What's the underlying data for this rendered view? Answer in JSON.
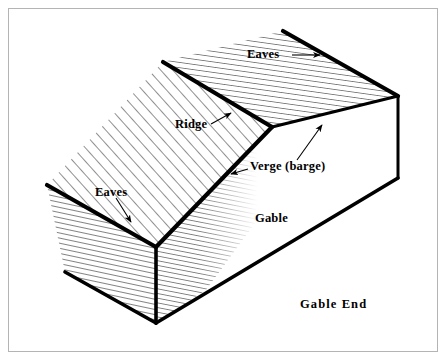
{
  "figure": {
    "background_color": "#ffffff",
    "frame_color": "#b4b4b4",
    "line_color": "#000000",
    "hatch_color": "#3a3a3a"
  },
  "labels": {
    "eaves_top": "Eaves",
    "eaves_left": "Eaves",
    "ridge": "Ridge",
    "verge": "Verge (barge)",
    "gable": "Gable",
    "gable_end": "Gable End"
  },
  "annotations": [
    {
      "name": "eaves-top",
      "text": "Eaves",
      "leader": "horizontal arrow pointing right to far eave line"
    },
    {
      "name": "eaves-left",
      "text": "Eaves",
      "leader": "arrow pointing down-right to near eave line"
    },
    {
      "name": "ridge",
      "text": "Ridge",
      "leader": "arrow pointing up-right to ridge line"
    },
    {
      "name": "verge",
      "text": "Verge (barge)",
      "leader": "two leaders: one left-down to near verge, one up-right to far verge"
    },
    {
      "name": "gable",
      "text": "Gable",
      "leader": "none"
    },
    {
      "name": "gable-end",
      "text": "Gable End",
      "leader": "none"
    }
  ]
}
